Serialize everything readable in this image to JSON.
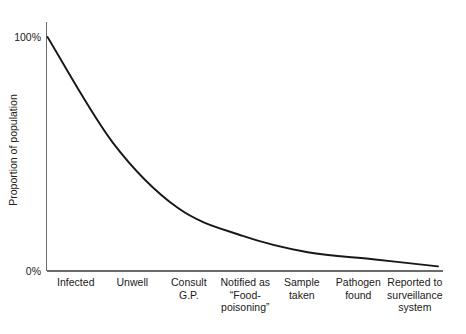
{
  "chart_data": {
    "type": "line",
    "title": "",
    "subtitle": "",
    "xlabel": "",
    "ylabel": "Proportion of population",
    "categories": [
      "Infected",
      "Unwell",
      "Consult G.P.",
      "Notified as “Food-poisoning”",
      "Sample taken",
      "Pathogen found",
      "Reported to surveillance system"
    ],
    "category_lines": [
      [
        "Infected"
      ],
      [
        "Unwell"
      ],
      [
        "Consult",
        "G.P."
      ],
      [
        "Notified as",
        "“Food-",
        "poisoning”"
      ],
      [
        "Sample",
        "taken"
      ],
      [
        "Pathogen",
        "found"
      ],
      [
        "Reported to",
        "surveillance",
        "system"
      ]
    ],
    "values": [
      100,
      55,
      27,
      15,
      8,
      5,
      2
    ],
    "ylim": [
      0,
      100
    ],
    "ytick_labels": [
      "100%",
      "0%"
    ],
    "ytick_values": [
      100,
      0
    ],
    "grid": false,
    "legend": false,
    "legend_position": "none",
    "series": [
      {
        "name": "Proportion of population",
        "values": [
          100,
          55,
          27,
          15,
          8,
          5,
          2
        ],
        "color": "#171717"
      }
    ],
    "annotations": []
  },
  "axes": {
    "y_axis_top_label": "100%",
    "y_axis_bottom_label": "0%",
    "y_axis_title": "Proportion of population",
    "axis_color": "#6b6b6b",
    "curve_color": "#171717",
    "background": "#ffffff"
  }
}
